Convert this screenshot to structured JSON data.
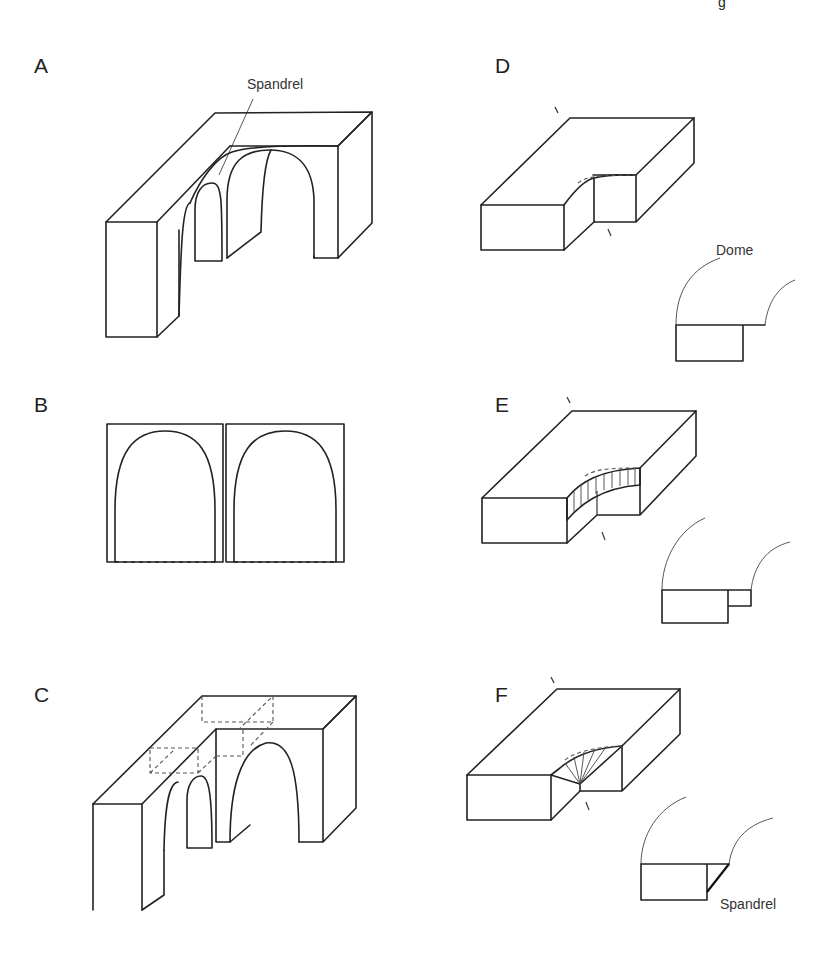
{
  "figure": {
    "corner_fragment": "g",
    "panels": [
      {
        "id": "A",
        "label": "A",
        "annotation": "Spandrel"
      },
      {
        "id": "B",
        "label": "B"
      },
      {
        "id": "C",
        "label": "C"
      },
      {
        "id": "D",
        "label": "D",
        "annotation": "Dome"
      },
      {
        "id": "E",
        "label": "E"
      },
      {
        "id": "F",
        "label": "F",
        "annotation": "Spandrel"
      }
    ]
  }
}
